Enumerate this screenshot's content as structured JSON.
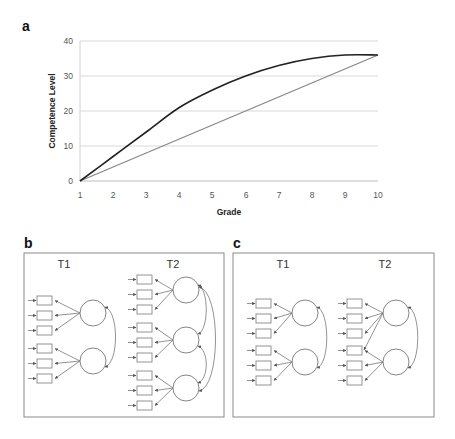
{
  "panel_a": {
    "letter": "a",
    "ylabel": "Competence Level",
    "xlabel": "Grade",
    "yticks": [
      "0",
      "10",
      "20",
      "30",
      "40"
    ],
    "xticks": [
      "1",
      "2",
      "3",
      "4",
      "5",
      "6",
      "7",
      "8",
      "9",
      "10"
    ]
  },
  "panel_b": {
    "letter": "b",
    "t1_label": "T1",
    "t2_label": "T2"
  },
  "panel_c": {
    "letter": "c",
    "t1_label": "T1",
    "t2_label": "T2"
  },
  "colors": {
    "curve": "#222222",
    "linear": "#888888",
    "grid": "#d9d9d9"
  },
  "chart_data": {
    "type": "line",
    "title": "",
    "xlabel": "Grade",
    "ylabel": "Competence Level",
    "x": [
      1,
      2,
      3,
      4,
      5,
      6,
      7,
      8,
      9,
      10
    ],
    "series": [
      {
        "name": "nonlinear development",
        "color": "#222222",
        "values": [
          0,
          7,
          14,
          21,
          26,
          30,
          33,
          35,
          36,
          36
        ]
      },
      {
        "name": "linear development",
        "color": "#888888",
        "values": [
          0,
          4,
          8,
          12,
          16,
          20,
          24,
          28,
          32,
          36
        ]
      }
    ],
    "xlim": [
      1,
      10
    ],
    "ylim": [
      0,
      40
    ],
    "grid": true,
    "legend": "none"
  }
}
